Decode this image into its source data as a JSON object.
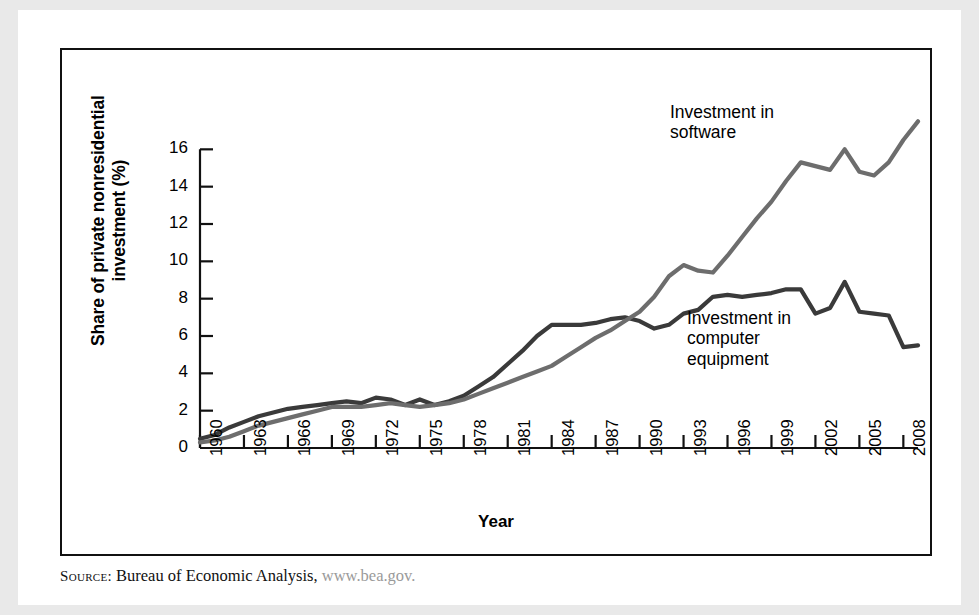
{
  "figure": {
    "source_label": "Source:",
    "source_text": " Bureau of Economic Analysis, ",
    "source_url": "www.bea.gov."
  },
  "chart_data": {
    "type": "line",
    "title": "",
    "xlabel": "Year",
    "ylabel": "Share of private\nnonresidential investment (%)",
    "ylim": [
      0,
      18
    ],
    "xlim": [
      1960,
      2009
    ],
    "grid": false,
    "legend_position": "inline-annotations",
    "yticks": [
      0,
      2,
      4,
      6,
      8,
      10,
      12,
      14,
      16
    ],
    "xticks": [
      1960,
      1963,
      1966,
      1969,
      1972,
      1975,
      1978,
      1981,
      1984,
      1987,
      1990,
      1993,
      1996,
      1999,
      2002,
      2005,
      2008
    ],
    "x": [
      1960,
      1961,
      1962,
      1963,
      1964,
      1965,
      1966,
      1967,
      1968,
      1969,
      1970,
      1971,
      1972,
      1973,
      1974,
      1975,
      1976,
      1977,
      1978,
      1979,
      1980,
      1981,
      1982,
      1983,
      1984,
      1985,
      1986,
      1987,
      1988,
      1989,
      1990,
      1991,
      1992,
      1993,
      1994,
      1995,
      1996,
      1997,
      1998,
      1999,
      2000,
      2001,
      2002,
      2003,
      2004,
      2005,
      2006,
      2007,
      2008,
      2009
    ],
    "series": [
      {
        "name": "Investment in computer equipment",
        "color": "#3a3a3a",
        "annotation": "Investment in\ncomputer\nequipment",
        "values": [
          0.5,
          0.7,
          1.1,
          1.4,
          1.7,
          1.9,
          2.1,
          2.2,
          2.3,
          2.4,
          2.5,
          2.4,
          2.7,
          2.6,
          2.3,
          2.6,
          2.3,
          2.5,
          2.8,
          3.3,
          3.8,
          4.5,
          5.2,
          6.0,
          6.6,
          6.6,
          6.6,
          6.7,
          6.9,
          7.0,
          6.8,
          6.4,
          6.6,
          7.2,
          7.4,
          8.1,
          8.2,
          8.1,
          8.2,
          8.3,
          8.5,
          8.5,
          7.2,
          7.5,
          8.9,
          7.3,
          7.2,
          7.1,
          5.4,
          5.5
        ]
      },
      {
        "name": "Investment in software",
        "color": "#6d6d6d",
        "annotation": "Investment in\nsoftware",
        "values": [
          0.3,
          0.4,
          0.6,
          0.9,
          1.2,
          1.4,
          1.6,
          1.8,
          2.0,
          2.2,
          2.2,
          2.2,
          2.3,
          2.4,
          2.3,
          2.2,
          2.3,
          2.4,
          2.6,
          2.9,
          3.2,
          3.5,
          3.8,
          4.1,
          4.4,
          4.9,
          5.4,
          5.9,
          6.3,
          6.8,
          7.3,
          8.1,
          9.2,
          9.8,
          9.5,
          9.4,
          10.3,
          11.3,
          12.3,
          13.2,
          14.3,
          15.3,
          15.1,
          14.9,
          16.0,
          14.8,
          14.6,
          15.3,
          16.5,
          17.5
        ]
      }
    ]
  }
}
